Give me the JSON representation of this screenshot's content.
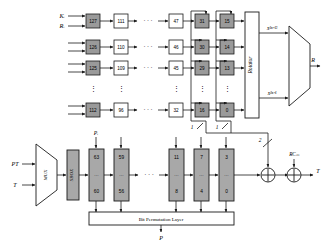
{
  "figure": {
    "colors": {
      "shaded_box_fill": "#9a9a9a",
      "light_box_fill": "#ffffff",
      "gray_block_fill": "#a8a8a8",
      "stroke": "#1a1a1a",
      "background": "#ffffff"
    }
  },
  "key_schedule": {
    "inputs": [
      {
        "label": "Kᵢ",
        "name": "key-input"
      },
      {
        "label": "Rᵢ",
        "name": "round-input"
      }
    ],
    "rows": [
      {
        "cells": [
          {
            "value": "127",
            "shaded": true
          },
          {
            "value": "111",
            "shaded": false
          },
          {
            "value": "47",
            "shaded": false
          },
          {
            "value": "31",
            "shaded": true
          },
          {
            "value": "15",
            "shaded": true
          }
        ]
      },
      {
        "cells": [
          {
            "value": "126",
            "shaded": true
          },
          {
            "value": "110",
            "shaded": false
          },
          {
            "value": "46",
            "shaded": false
          },
          {
            "value": "30",
            "shaded": true
          },
          {
            "value": "14",
            "shaded": true
          }
        ]
      },
      {
        "cells": [
          {
            "value": "125",
            "shaded": true
          },
          {
            "value": "109",
            "shaded": false
          },
          {
            "value": "45",
            "shaded": false
          },
          {
            "value": "29",
            "shaded": true
          },
          {
            "value": "13",
            "shaded": true
          }
        ]
      },
      {
        "cells": [
          {
            "value": "112",
            "shaded": true
          },
          {
            "value": "96",
            "shaded": false
          },
          {
            "value": "32",
            "shaded": false
          },
          {
            "value": "16",
            "shaded": true
          },
          {
            "value": "0",
            "shaded": true
          }
        ]
      }
    ],
    "rotator": {
      "label": "Rotator"
    },
    "tap_labels": [
      {
        "value": "1",
        "name": "tap-width-left"
      },
      {
        "value": "1",
        "name": "tap-width-right"
      }
    ],
    "mux_outputs": [
      {
        "label": "X²ⁿ⁺¹³",
        "name": "rotator-output-high"
      },
      {
        "label": "X²ⁿ⁺¹",
        "name": "rotator-output-low"
      }
    ],
    "final_output": {
      "label": "R",
      "name": "key-schedule-output"
    }
  },
  "datapath": {
    "inputs": [
      {
        "label": "PT",
        "name": "plaintext-input"
      },
      {
        "label": "T",
        "name": "tag-input"
      }
    ],
    "mux": {
      "label": "MUX"
    },
    "sbox": {
      "label": "SBOX"
    },
    "state_label": {
      "label": "Pᵢ"
    },
    "registers": [
      {
        "top": "63",
        "mid": "…",
        "bottom": "60"
      },
      {
        "top": "59",
        "mid": "…",
        "bottom": "56"
      },
      {
        "top": "11",
        "mid": "…",
        "bottom": "8"
      },
      {
        "top": "7",
        "mid": "…",
        "bottom": "4"
      },
      {
        "top": "3",
        "mid": "…",
        "bottom": "0"
      }
    ],
    "permutation_layer": {
      "label": "Bit Permutation Layer"
    },
    "permutation_output": {
      "label": "P"
    },
    "xor_left": {
      "symbol": "⊕",
      "name": "xor-key-gate"
    },
    "xor_right": {
      "symbol": "⊕",
      "name": "xor-roundconst-gate"
    },
    "round_constant": {
      "label": "RCₘ"
    },
    "feedback_width": {
      "value": "2"
    },
    "output": {
      "label": "T"
    }
  },
  "ellipses": {
    "horizontal": "· · ·",
    "vertical": "⋮"
  }
}
